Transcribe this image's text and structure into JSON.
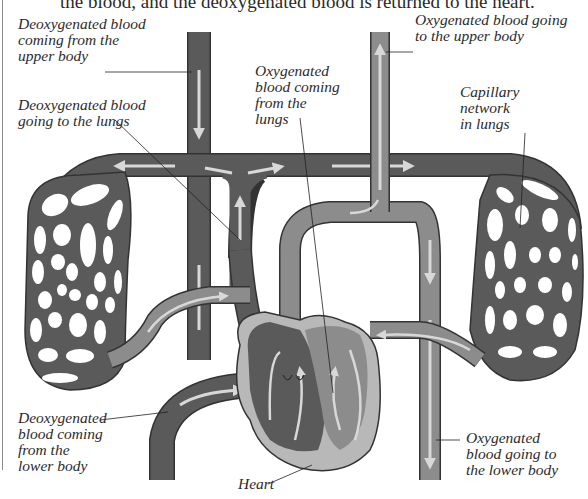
{
  "caption": {
    "partial_text": "the blood, and the deoxygenated blood is returned to the heart."
  },
  "diagram": {
    "colors": {
      "deoxygenated": "#5a5a5a",
      "oxygenated": "#8c8c8c",
      "heart_wall": "#b8b8b8",
      "arrow": "#d8d8d8",
      "outline": "#333333",
      "background": "#ffffff"
    },
    "labels": {
      "deox_upper": "Deoxygenated blood\ncoming from the\nupper body",
      "deox_to_lungs": "Deoxygenated blood\ngoing to the lungs",
      "ox_from_lungs": "Oxygenated\nblood coming\nfrom the\nlungs",
      "ox_upper": "Oxygenated blood going\nto the upper body",
      "capillary": "Capillary\nnetwork\nin lungs",
      "deox_lower": "Deoxygenated\nblood coming\nfrom the\nlower body",
      "heart": "Heart",
      "ox_lower": "Oxygenated\nblood going to\nthe lower body"
    }
  }
}
